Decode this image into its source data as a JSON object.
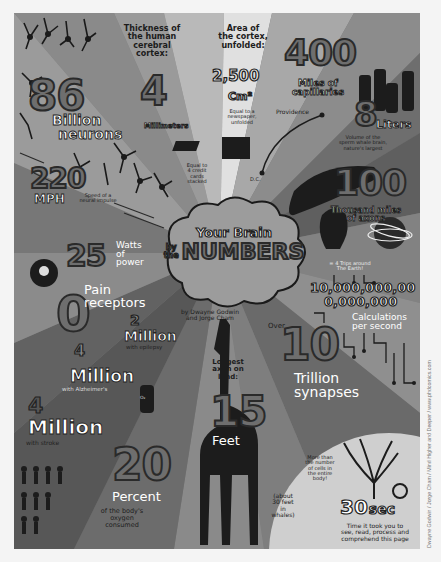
{
  "poster": {
    "title_line1": "Your Brain",
    "title_by": "by",
    "title_the": "the",
    "title_line2": "NUMBERS",
    "authors": "by Dwayne Godwin and Jorge Cham",
    "authors_line1": "by Dwayne Godwin",
    "authors_line2": "and Jorge Cham",
    "credit": "Dwayne Godwin / Jorge Cham / Mind Higher and Deeper / www.phdcomics.com",
    "colors": {
      "background": "#f4f4f4",
      "ray_dark": "#5e5e5e",
      "ray_mid": "#7a7a7a",
      "ray_light": "#b8b8b8",
      "ray_lightest": "#dcdcdc",
      "number_fill": "#6e6e6e",
      "ink": "#1c1c1c",
      "label_white": "#ffffff"
    }
  },
  "facts": {
    "neurons": {
      "number": "86",
      "label1": "Billion",
      "label2": "neurons"
    },
    "cortex_thickness": {
      "heading": [
        "Thickness of",
        "the human",
        "cerebral",
        "cortex:"
      ],
      "number": "4",
      "unit": "Millimeters",
      "note": [
        "Equal to",
        "4 credit",
        "cards",
        "stacked"
      ]
    },
    "cortex_area": {
      "heading": [
        "Area of",
        "the cortex,",
        "unfolded:"
      ],
      "number": "2,500",
      "unit": "Cm²",
      "note": [
        "Equal to a",
        "newspaper,",
        "unfolded"
      ]
    },
    "capillaries": {
      "number": "400",
      "label": [
        "Miles of",
        "capillaries"
      ],
      "map_labels": {
        "from": "D.C.",
        "to": "Providence"
      }
    },
    "whale_brain": {
      "number": "8",
      "unit": "Liters",
      "note": [
        "Volume of the",
        "sperm whale brain,",
        "nature's largest"
      ]
    },
    "nerve_speed": {
      "number": "220",
      "unit": "MPH",
      "note": [
        "Speed of a",
        "neural impulse"
      ]
    },
    "power": {
      "number": "25",
      "label": [
        "Watts",
        "of",
        "power"
      ]
    },
    "axons": {
      "number": "100",
      "label": [
        "Thousand miles",
        "of axons"
      ],
      "note": [
        "= 4 Trips around",
        "The Earth!"
      ]
    },
    "pain": {
      "number": "0",
      "label": [
        "Pain",
        "receptors"
      ]
    },
    "calculations": {
      "number_line1": "10,000,000,00",
      "number_line2": "0,000,000",
      "label": [
        "Calculations",
        "per second"
      ]
    },
    "epilepsy": {
      "number": "2",
      "unit": "Million",
      "note": "with epilepsy"
    },
    "alzheimers": {
      "number": "4",
      "unit": "Million",
      "note": "with Alzheimer's"
    },
    "stroke": {
      "number": "4",
      "unit": "Million",
      "note": "with stroke"
    },
    "longest_axon": {
      "heading": [
        "Longest",
        "axon on",
        "land:"
      ],
      "number": "15",
      "unit": "Feet",
      "note": [
        "(about",
        "30 feet",
        "in",
        "whales)"
      ]
    },
    "synapses": {
      "prefix": "Over",
      "number": "10",
      "label": [
        "Trillion",
        "synapses"
      ],
      "note": [
        "More than",
        "the number",
        "of cells in",
        "the entire",
        "body!"
      ]
    },
    "oxygen": {
      "number": "20",
      "unit": "Percent",
      "note": [
        "of the body's",
        "oxygen",
        "consumed"
      ],
      "tank_label": "O₂"
    },
    "reading_time": {
      "number": "30",
      "unit": "sec",
      "note": [
        "Time it took you to",
        "see, read, process and",
        "comprehend this page"
      ]
    }
  }
}
